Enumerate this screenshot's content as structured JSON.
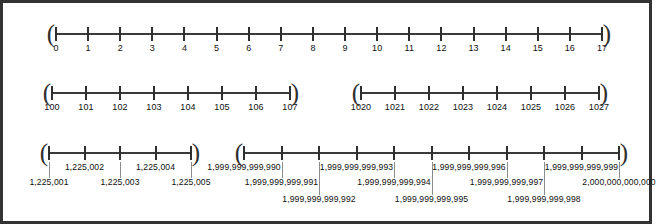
{
  "figure": {
    "type": "number-lines-worksheet",
    "border_color": "#333333",
    "axis_color": "#3a3a3a",
    "tick_color": "#2f2f2f",
    "leader_color": "#8d8d8d",
    "text_color": "#111111",
    "background": "#ffffff"
  },
  "lines": [
    {
      "id": "line-1",
      "name": "number-line-ones",
      "bracket_left": "(",
      "bracket_right": ")",
      "ticks": [
        {
          "label": "0"
        },
        {
          "label": "1"
        },
        {
          "label": "2"
        },
        {
          "label": "3"
        },
        {
          "label": "4"
        },
        {
          "label": "5"
        },
        {
          "label": "6"
        },
        {
          "label": "7"
        },
        {
          "label": "8"
        },
        {
          "label": "9"
        },
        {
          "label": "10"
        },
        {
          "label": "11"
        },
        {
          "label": "12"
        },
        {
          "label": "13"
        },
        {
          "label": "14"
        },
        {
          "label": "15"
        },
        {
          "label": "16"
        },
        {
          "label": "17"
        }
      ]
    },
    {
      "id": "line-2a",
      "name": "number-line-hundreds",
      "bracket_left": "(",
      "bracket_right": ")",
      "ticks": [
        {
          "label": "100"
        },
        {
          "label": "101"
        },
        {
          "label": "102"
        },
        {
          "label": "103"
        },
        {
          "label": "104"
        },
        {
          "label": "105"
        },
        {
          "label": "106"
        },
        {
          "label": "107"
        }
      ]
    },
    {
      "id": "line-2b",
      "name": "number-line-thousands",
      "bracket_left": "(",
      "bracket_right": ")",
      "ticks": [
        {
          "label": "1020"
        },
        {
          "label": "1021"
        },
        {
          "label": "1022"
        },
        {
          "label": "1023"
        },
        {
          "label": "1024"
        },
        {
          "label": "1025"
        },
        {
          "label": "1026"
        },
        {
          "label": "1027"
        }
      ]
    },
    {
      "id": "line-3a",
      "name": "number-line-millions",
      "bracket_left": "(",
      "bracket_right": ")",
      "ticks": [
        {
          "label": "1,225,001",
          "row": 1
        },
        {
          "label": "1,225,002",
          "row": 0
        },
        {
          "label": "1,225,003",
          "row": 1
        },
        {
          "label": "1,225,004",
          "row": 0
        },
        {
          "label": "1,225,005",
          "row": 1
        }
      ]
    },
    {
      "id": "line-3b",
      "name": "number-line-trillions",
      "bracket_left": "(",
      "bracket_right": ")",
      "ticks": [
        {
          "label": "1,999,999,999,990",
          "row": 0
        },
        {
          "label": "1,999,999,999,991",
          "row": 1
        },
        {
          "label": "1,999,999,999,992",
          "row": 2
        },
        {
          "label": "1,999,999,999,993",
          "row": 0
        },
        {
          "label": "1,999,999,999,994",
          "row": 1
        },
        {
          "label": "1,999,999,999,995",
          "row": 2
        },
        {
          "label": "1,999,999,999,996",
          "row": 0
        },
        {
          "label": "1,999,999,999,997",
          "row": 1
        },
        {
          "label": "1,999,999,999,998",
          "row": 2
        },
        {
          "label": "1,999,999,999,999",
          "row": 0
        },
        {
          "label": "2,000,000,000,000",
          "row": 1
        }
      ]
    }
  ]
}
